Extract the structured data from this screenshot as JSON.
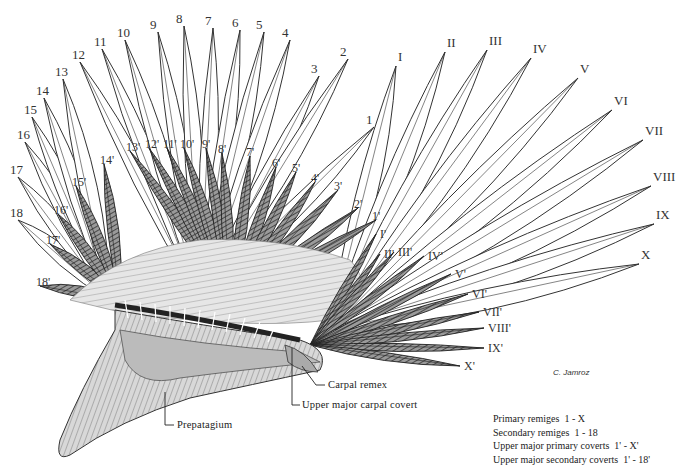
{
  "secondary_labels": [
    {
      "t": "1",
      "x": 366,
      "y": 113
    },
    {
      "t": "2",
      "x": 340,
      "y": 45
    },
    {
      "t": "3",
      "x": 311,
      "y": 62
    },
    {
      "t": "4",
      "x": 282,
      "y": 26
    },
    {
      "t": "5",
      "x": 256,
      "y": 18
    },
    {
      "t": "6",
      "x": 232,
      "y": 16
    },
    {
      "t": "7",
      "x": 205,
      "y": 14
    },
    {
      "t": "8",
      "x": 176,
      "y": 12
    },
    {
      "t": "9",
      "x": 150,
      "y": 18
    },
    {
      "t": "10",
      "x": 117,
      "y": 26
    },
    {
      "t": "11",
      "x": 94,
      "y": 35
    },
    {
      "t": "12",
      "x": 72,
      "y": 48
    },
    {
      "t": "13",
      "x": 55,
      "y": 65
    },
    {
      "t": "14",
      "x": 36,
      "y": 84
    },
    {
      "t": "15",
      "x": 24,
      "y": 103
    },
    {
      "t": "16",
      "x": 17,
      "y": 128
    },
    {
      "t": "17",
      "x": 10,
      "y": 163
    },
    {
      "t": "18",
      "x": 10,
      "y": 206
    }
  ],
  "primary_labels": [
    {
      "t": "I",
      "x": 398,
      "y": 50
    },
    {
      "t": "II",
      "x": 447,
      "y": 36
    },
    {
      "t": "III",
      "x": 489,
      "y": 34
    },
    {
      "t": "IV",
      "x": 533,
      "y": 42
    },
    {
      "t": "V",
      "x": 580,
      "y": 62
    },
    {
      "t": "VI",
      "x": 614,
      "y": 94
    },
    {
      "t": "VII",
      "x": 645,
      "y": 124
    },
    {
      "t": "VIII",
      "x": 653,
      "y": 170
    },
    {
      "t": "IX",
      "x": 656,
      "y": 208
    },
    {
      "t": "X",
      "x": 641,
      "y": 248
    }
  ],
  "secondary_covert_labels": [
    {
      "t": "1'",
      "x": 372,
      "y": 210
    },
    {
      "t": "2'",
      "x": 354,
      "y": 198
    },
    {
      "t": "3'",
      "x": 334,
      "y": 180
    },
    {
      "t": "4'",
      "x": 311,
      "y": 172
    },
    {
      "t": "5'",
      "x": 292,
      "y": 162
    },
    {
      "t": "6'",
      "x": 272,
      "y": 157
    },
    {
      "t": "7'",
      "x": 246,
      "y": 146
    },
    {
      "t": "8'",
      "x": 218,
      "y": 143
    },
    {
      "t": "9'",
      "x": 202,
      "y": 138
    },
    {
      "t": "10'",
      "x": 180,
      "y": 138
    },
    {
      "t": "11'",
      "x": 163,
      "y": 138
    },
    {
      "t": "12'",
      "x": 145,
      "y": 138
    },
    {
      "t": "13'",
      "x": 126,
      "y": 141
    },
    {
      "t": "14'",
      "x": 100,
      "y": 154
    },
    {
      "t": "15'",
      "x": 72,
      "y": 176
    },
    {
      "t": "16'",
      "x": 54,
      "y": 204
    },
    {
      "t": "17'",
      "x": 46,
      "y": 234
    },
    {
      "t": "18'",
      "x": 36,
      "y": 276
    }
  ],
  "primary_covert_labels": [
    {
      "t": "I'",
      "x": 380,
      "y": 228
    },
    {
      "t": "II'",
      "x": 384,
      "y": 248
    },
    {
      "t": "III'",
      "x": 398,
      "y": 246
    },
    {
      "t": "IV'",
      "x": 428,
      "y": 250
    },
    {
      "t": "V'",
      "x": 455,
      "y": 268
    },
    {
      "t": "VI'",
      "x": 472,
      "y": 288
    },
    {
      "t": "VII'",
      "x": 483,
      "y": 306
    },
    {
      "t": "VIII'",
      "x": 488,
      "y": 322
    },
    {
      "t": "IX'",
      "x": 488,
      "y": 342
    },
    {
      "t": "X'",
      "x": 464,
      "y": 360
    }
  ],
  "callouts": {
    "carpal_remex": "Carpal remex",
    "upper_major_carpal_covert": "Upper major carpal covert",
    "prepatagium": "Prepatagium"
  },
  "legend": [
    {
      "label": "Primary remiges",
      "range": "1 - X"
    },
    {
      "label": "Secondary remiges",
      "range": "1 - 18"
    },
    {
      "label": "Upper major primary coverts",
      "range": "1' - X'"
    },
    {
      "label": "Upper major secondary coverts",
      "range": "1' - 18'"
    }
  ],
  "signature": "C. Jamroz"
}
